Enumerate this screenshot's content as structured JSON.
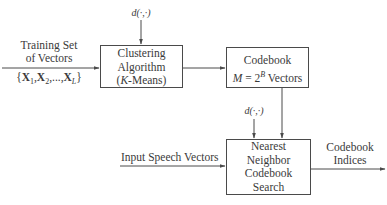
{
  "diagram": {
    "type": "block-diagram",
    "inputs": {
      "training": {
        "label_line1": "Training Set",
        "label_line2": "of Vectors",
        "set_notation": "{X1, X2, ..., XL}"
      },
      "speech": {
        "label": "Input Speech Vectors"
      }
    },
    "blocks": {
      "clustering": {
        "line1": "Clustering",
        "line2": "Algorithm",
        "line3_var": "K",
        "line3_rest": "-Means)"
      },
      "codebook": {
        "line1": "Codebook",
        "line2_var": "M",
        "line2_eq": " = 2",
        "line2_exp": "B",
        "line2_rest": " Vectors"
      },
      "search": {
        "line1": "Nearest",
        "line2": "Neighbor",
        "line3": "Codebook",
        "line4": "Search"
      }
    },
    "distance_labels": {
      "top": "d(·,·)",
      "bottom": "d(·,·)"
    },
    "output": {
      "line1": "Codebook",
      "line2": "Indices"
    },
    "colors": {
      "line": "#4a4a4a",
      "text": "#3a3a3a",
      "background": "#ffffff"
    }
  }
}
